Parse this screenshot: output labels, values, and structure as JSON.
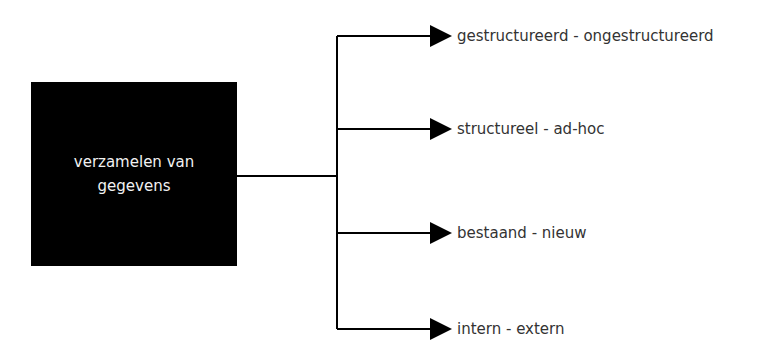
{
  "diagram": {
    "source_node": {
      "label": "verzamelen van gegevens"
    },
    "branches": [
      {
        "label": "gestructureerd - ongestructureerd",
        "y": 36
      },
      {
        "label": "structureel - ad-hoc",
        "y": 129
      },
      {
        "label": "bestaand - nieuw",
        "y": 233
      },
      {
        "label": "intern - extern",
        "y": 329
      }
    ],
    "colors": {
      "box": "#000000",
      "box_text": "#f2f2f2",
      "line": "#000000",
      "label_text": "#333333"
    }
  }
}
